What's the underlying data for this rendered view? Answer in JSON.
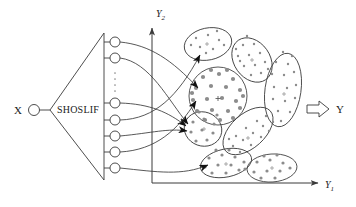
{
  "figure": {
    "type": "diagram",
    "background_color": "#ffffff",
    "line_color": "#3a3a3a",
    "dot_color": "#8c8c8c"
  },
  "input": {
    "label": "X",
    "node_name": "input-node"
  },
  "module": {
    "label": "SHOSLIF",
    "shape": "triangle"
  },
  "output_nodes": {
    "count": 7,
    "ellipsis": "⋮",
    "positions_y": [
      42,
      58,
      103,
      120,
      136,
      152,
      168
    ]
  },
  "axes": {
    "x_label": "Y",
    "x_sub": "1",
    "y_label": "Y",
    "y_sub": "2",
    "origin_x": 152,
    "origin_y": 183
  },
  "output": {
    "arrow": "⇒",
    "label": "Y"
  },
  "clusters": [
    {
      "name": "cluster-top-left",
      "cx": 208,
      "cy": 44,
      "rx": 24,
      "ry": 16,
      "rot": -12,
      "dots": 9,
      "dot_size": 1.3,
      "has_arrow": true
    },
    {
      "name": "cluster-top-right",
      "cx": 252,
      "cy": 60,
      "rx": 24,
      "ry": 18,
      "rot": 55,
      "dots": 14,
      "dot_size": 1.3,
      "has_arrow": false
    },
    {
      "name": "cluster-center-big",
      "cx": 218,
      "cy": 96,
      "rx": 29,
      "ry": 29,
      "rot": 0,
      "dots": 22,
      "dot_size": 2.1,
      "has_arrow": true
    },
    {
      "name": "cluster-right-tall",
      "cx": 283,
      "cy": 90,
      "rx": 18,
      "ry": 37,
      "rot": 8,
      "dots": 16,
      "dot_size": 1.3,
      "has_arrow": false
    },
    {
      "name": "cluster-mid-left",
      "cx": 203,
      "cy": 129,
      "rx": 19,
      "ry": 17,
      "rot": 20,
      "dots": 10,
      "dot_size": 1.6,
      "has_arrow": true
    },
    {
      "name": "cluster-mid-right",
      "cx": 248,
      "cy": 131,
      "rx": 30,
      "ry": 17,
      "rot": -42,
      "dots": 14,
      "dot_size": 1.3,
      "has_arrow": false
    },
    {
      "name": "cluster-bottom-left",
      "cx": 226,
      "cy": 163,
      "rx": 26,
      "ry": 14,
      "rot": -12,
      "dots": 13,
      "dot_size": 1.6,
      "has_arrow": true
    },
    {
      "name": "cluster-bottom-right",
      "cx": 272,
      "cy": 168,
      "rx": 25,
      "ry": 14,
      "rot": -4,
      "dots": 11,
      "dot_size": 1.6,
      "has_arrow": false
    }
  ],
  "connections": [
    {
      "name": "link-node1-to-center",
      "from_node": 0,
      "to_cluster": 2
    },
    {
      "name": "link-node2-to-mid-left",
      "from_node": 1,
      "to_cluster": 4
    },
    {
      "name": "link-node3-to-mid-left",
      "from_node": 2,
      "to_cluster": 4
    },
    {
      "name": "link-node4-to-top-left",
      "from_node": 3,
      "to_cluster": 0
    },
    {
      "name": "link-node5-to-mid-left",
      "from_node": 4,
      "to_cluster": 4
    },
    {
      "name": "link-node6-to-center",
      "from_node": 5,
      "to_cluster": 2
    },
    {
      "name": "link-node7-to-bottom-left",
      "from_node": 6,
      "to_cluster": 6
    }
  ]
}
